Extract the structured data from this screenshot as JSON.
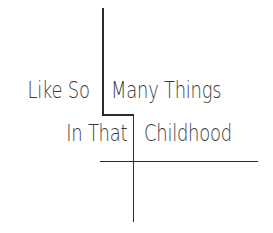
{
  "artwork": {
    "line1": {
      "left": "Like So",
      "right": "Many Things"
    },
    "line2": {
      "left": "In That",
      "right": "Childhood"
    }
  },
  "colors": {
    "background": "#ffffff",
    "text": "#3a3a3a",
    "rule": "#2b2b2b"
  }
}
